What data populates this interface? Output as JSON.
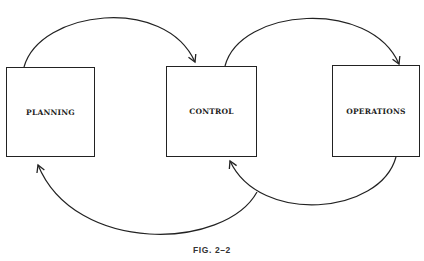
{
  "diagram": {
    "boxes": [
      {
        "id": "planning",
        "label": "PLANNING"
      },
      {
        "id": "control",
        "label": "CONTROL"
      },
      {
        "id": "operations",
        "label": "OPERATIONS"
      }
    ],
    "arrows": [
      {
        "from": "planning",
        "to": "control",
        "position": "top"
      },
      {
        "from": "control",
        "to": "operations",
        "position": "top"
      },
      {
        "from": "operations",
        "to": "control",
        "position": "bottom"
      },
      {
        "from": "control",
        "to": "planning",
        "position": "bottom"
      }
    ],
    "caption": "FIG. 2–2",
    "stroke_color": "#222222"
  }
}
